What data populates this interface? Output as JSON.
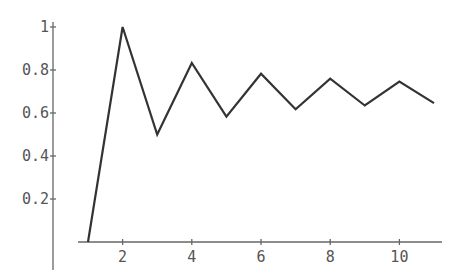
{
  "chart_data": {
    "type": "line",
    "title": "",
    "xlabel": "",
    "ylabel": "",
    "x": [
      1,
      2,
      3,
      4,
      5,
      6,
      7,
      8,
      9,
      10,
      11
    ],
    "series": [
      {
        "name": "partial sums",
        "values": [
          0,
          1,
          0.5,
          0.833,
          0.583,
          0.783,
          0.617,
          0.76,
          0.635,
          0.746,
          0.646
        ]
      }
    ],
    "x_ticks": [
      "2",
      "4",
      "6",
      "8",
      "10"
    ],
    "y_ticks": [
      "0.2",
      "0.4",
      "0.6",
      "0.8",
      "1"
    ],
    "xlim": [
      0.2,
      11.5
    ],
    "ylim": [
      0,
      1
    ],
    "grid": false,
    "legend": "none",
    "colors": {
      "line": "#333333",
      "axis": "#666666",
      "labels": "#555555"
    }
  }
}
